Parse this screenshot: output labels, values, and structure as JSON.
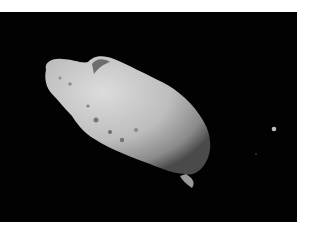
{
  "image": {
    "subject": "asteroid with small moon against black space",
    "background_color": "#020202",
    "page_color": "#ffffff",
    "asteroid_color": "#c8c8c8",
    "moon_color": "#bdbdbd"
  }
}
